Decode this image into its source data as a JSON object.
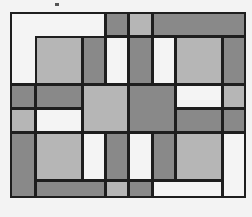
{
  "title": "",
  "colors": {
    "white": "#f4f4f4",
    "light": "#b6b6b6",
    "dark": "#898989",
    "line": "#1e1e1e",
    "background": "#f3f3f3"
  },
  "outer_frame": {
    "x": 10,
    "y": 12,
    "w": 236,
    "h": 186
  },
  "inner_frame": {
    "x": 35,
    "y": 36,
    "w": 188,
    "h": 145
  },
  "cells": [
    {
      "x": 10,
      "y": 12,
      "w": 96,
      "h": 73,
      "fill": "white"
    },
    {
      "x": 105,
      "y": 12,
      "w": 24,
      "h": 25,
      "fill": "dark"
    },
    {
      "x": 128,
      "y": 12,
      "w": 25,
      "h": 25,
      "fill": "light"
    },
    {
      "x": 152,
      "y": 12,
      "w": 94,
      "h": 25,
      "fill": "dark"
    },
    {
      "x": 222,
      "y": 36,
      "w": 24,
      "h": 49,
      "fill": "dark"
    },
    {
      "x": 35,
      "y": 36,
      "w": 48,
      "h": 49,
      "fill": "light"
    },
    {
      "x": 82,
      "y": 36,
      "w": 24,
      "h": 49,
      "fill": "dark"
    },
    {
      "x": 105,
      "y": 36,
      "w": 24,
      "h": 49,
      "fill": "white"
    },
    {
      "x": 128,
      "y": 36,
      "w": 25,
      "h": 49,
      "fill": "dark"
    },
    {
      "x": 152,
      "y": 36,
      "w": 24,
      "h": 49,
      "fill": "white"
    },
    {
      "x": 175,
      "y": 36,
      "w": 48,
      "h": 49,
      "fill": "light"
    },
    {
      "x": 10,
      "y": 84,
      "w": 26,
      "h": 25,
      "fill": "dark"
    },
    {
      "x": 35,
      "y": 84,
      "w": 48,
      "h": 25,
      "fill": "dark"
    },
    {
      "x": 82,
      "y": 84,
      "w": 47,
      "h": 49,
      "fill": "light"
    },
    {
      "x": 128,
      "y": 84,
      "w": 48,
      "h": 49,
      "fill": "dark"
    },
    {
      "x": 175,
      "y": 84,
      "w": 48,
      "h": 25,
      "fill": "white"
    },
    {
      "x": 222,
      "y": 84,
      "w": 24,
      "h": 25,
      "fill": "light"
    },
    {
      "x": 10,
      "y": 108,
      "w": 26,
      "h": 25,
      "fill": "light"
    },
    {
      "x": 35,
      "y": 108,
      "w": 48,
      "h": 25,
      "fill": "white"
    },
    {
      "x": 175,
      "y": 108,
      "w": 48,
      "h": 25,
      "fill": "dark"
    },
    {
      "x": 222,
      "y": 108,
      "w": 24,
      "h": 25,
      "fill": "dark"
    },
    {
      "x": 10,
      "y": 132,
      "w": 26,
      "h": 66,
      "fill": "dark"
    },
    {
      "x": 35,
      "y": 132,
      "w": 48,
      "h": 49,
      "fill": "light"
    },
    {
      "x": 82,
      "y": 132,
      "w": 24,
      "h": 49,
      "fill": "white"
    },
    {
      "x": 105,
      "y": 132,
      "w": 24,
      "h": 49,
      "fill": "dark"
    },
    {
      "x": 128,
      "y": 132,
      "w": 25,
      "h": 49,
      "fill": "white"
    },
    {
      "x": 152,
      "y": 132,
      "w": 24,
      "h": 49,
      "fill": "dark"
    },
    {
      "x": 175,
      "y": 132,
      "w": 48,
      "h": 49,
      "fill": "light"
    },
    {
      "x": 222,
      "y": 132,
      "w": 24,
      "h": 66,
      "fill": "white"
    },
    {
      "x": 35,
      "y": 180,
      "w": 71,
      "h": 18,
      "fill": "dark"
    },
    {
      "x": 105,
      "y": 180,
      "w": 24,
      "h": 18,
      "fill": "light"
    },
    {
      "x": 128,
      "y": 180,
      "w": 25,
      "h": 18,
      "fill": "dark"
    },
    {
      "x": 152,
      "y": 180,
      "w": 71,
      "h": 18,
      "fill": "white"
    }
  ]
}
